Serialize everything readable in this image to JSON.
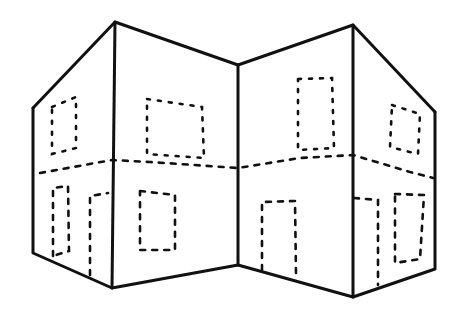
{
  "figure": {
    "stroke_color": "#111111",
    "background": "#ffffff"
  },
  "outline": {
    "edges": [
      "33,108 115,22 238,65 353,25 435,112",
      "33,108 33,253 112,288 238,265 353,297 435,269 435,112",
      "115,22 112,288",
      "238,65 238,265",
      "353,25 353,297"
    ]
  },
  "fold_line": {
    "points": "40,173 112,160 150,162 238,168 300,158 353,155 410,172 433,178"
  },
  "windows": [
    "52,107 76,97 76,148 52,154 52,107",
    "147,99 202,107 204,158 147,154 147,99",
    "298,79 332,78 334,148 298,150 298,79",
    "392,105 420,114 418,154 390,147 392,105"
  ],
  "doors": [
    "53,256 53,188 68,186 69,251 53,256",
    "90,275 90,196 108,193",
    "140,191 175,195 175,250 140,250 140,191",
    "262,270 262,202 295,201 296,274",
    "354,198 378,200 378,285",
    "395,194 424,195 420,259 395,263 395,194"
  ]
}
